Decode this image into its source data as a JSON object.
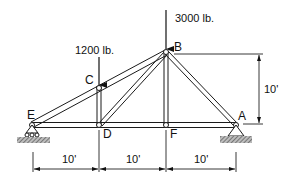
{
  "diagram": {
    "joints": [
      {
        "id": "E",
        "label": "E",
        "x": 0,
        "y": 0,
        "support": "roller"
      },
      {
        "id": "D",
        "label": "D",
        "x": 10,
        "y": 0
      },
      {
        "id": "F",
        "label": "F",
        "x": 20,
        "y": 0
      },
      {
        "id": "A",
        "label": "A",
        "x": 30,
        "y": 0,
        "support": "pin"
      },
      {
        "id": "C",
        "label": "C",
        "x": 10,
        "y": 5
      },
      {
        "id": "B",
        "label": "B",
        "x": 20,
        "y": 10
      }
    ],
    "members": [
      "E-C",
      "C-B",
      "B-A",
      "E-D",
      "D-F",
      "F-A",
      "C-D",
      "B-D",
      "B-F"
    ],
    "loads": [
      {
        "joint": "C",
        "label": "1200 lb.",
        "direction": "down"
      },
      {
        "joint": "B",
        "label": "3000 lb.",
        "direction": "down"
      }
    ],
    "dimensions": {
      "horizontal": [
        {
          "from": "E",
          "to": "D",
          "label": "10'"
        },
        {
          "from": "D",
          "to": "F",
          "label": "10'"
        },
        {
          "from": "F",
          "to": "A",
          "label": "10'"
        }
      ],
      "vertical": {
        "from": "A",
        "to": "B",
        "label": "10'"
      }
    },
    "colors": {
      "line": "#1a1a1a",
      "hatch": "#555555",
      "background": "#ffffff"
    }
  }
}
